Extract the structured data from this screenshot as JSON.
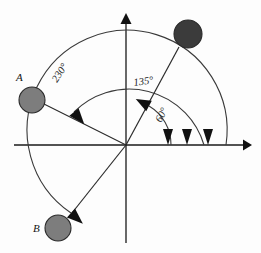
{
  "figure": {
    "background_color": "#fdfdfd",
    "width": 261,
    "height": 253
  },
  "axes": {
    "origin": {
      "x": 126,
      "y": 145
    },
    "x_axis_label": "",
    "y_axis_label": "",
    "x_axis": {
      "x1": 14,
      "y1": 145,
      "x2": 249,
      "y2": 145,
      "arrow": "right"
    },
    "y_axis": {
      "x1": 126,
      "y1": 243,
      "x2": 126,
      "y2": 16,
      "arrow": "up"
    }
  },
  "objects": [
    {
      "id": "ball-dark",
      "label": "",
      "cx": 188,
      "cy": 34,
      "r": 14,
      "fill": "#3b3b3b",
      "role": "initial-position"
    },
    {
      "id": "ball-a",
      "label": "A",
      "label_x": 20,
      "label_y": 80,
      "cx": 32,
      "cy": 100,
      "r": 13,
      "fill": "#7d7d7d",
      "role": "rotated-135"
    },
    {
      "id": "ball-b",
      "label": "B",
      "label_x": 36,
      "label_y": 228,
      "cx": 58,
      "cy": 228,
      "r": 13,
      "fill": "#7d7d7d",
      "role": "rotated-230"
    }
  ],
  "rays": [
    {
      "id": "ray-to-dark-ball",
      "from": "origin",
      "angle_deg": 60,
      "to_x": 178,
      "to_y": 46
    },
    {
      "id": "ray-to-ball-a",
      "from": "origin",
      "angle_deg": 195,
      "to_x": 44,
      "to_y": 105
    },
    {
      "id": "ray-to-ball-b",
      "from": "origin",
      "angle_deg": 250,
      "to_x": 68,
      "to_y": 218
    }
  ],
  "angles": [
    {
      "id": "angle-60",
      "label": "60°",
      "value": 60,
      "unit": "degrees",
      "label_x": 162,
      "label_y": 120,
      "label_rotation": -62,
      "arc_radius": 45,
      "direction": "counterclockwise",
      "from_deg": 0,
      "to_deg": 60
    },
    {
      "id": "angle-135",
      "label": "135°",
      "value": 135,
      "unit": "degrees",
      "label_x": 130,
      "label_y": 85,
      "label_rotation": -9,
      "arc_radius": 78,
      "direction": "counterclockwise",
      "from_deg": 0,
      "to_deg": 195
    },
    {
      "id": "angle-230",
      "label": "230°",
      "value": 230,
      "unit": "degrees",
      "label_x": 62,
      "label_y": 80,
      "label_rotation": -58,
      "arc_radius": 100,
      "direction": "counterclockwise",
      "from_deg": 0,
      "to_deg": 250
    }
  ],
  "arrow_marks": {
    "x_axis_terminal_arrows": [
      {
        "id": "terminal-arrow-1",
        "x": 168,
        "y": 145
      },
      {
        "id": "terminal-arrow-2",
        "x": 187,
        "y": 145
      },
      {
        "id": "terminal-arrow-3",
        "x": 208,
        "y": 145
      }
    ],
    "arc_end_arrow_60": {
      "x": 148,
      "y": 106,
      "rotation": -140
    },
    "arc_end_arrow_135": {
      "x": 76,
      "y": 113,
      "rotation": 118
    },
    "arc_end_arrow_230": {
      "x": 70,
      "y": 216,
      "rotation": 50
    }
  },
  "colors": {
    "stroke": "#1a1a1a",
    "ball_light": "#7d7d7d",
    "ball_dark": "#3b3b3b",
    "background": "#fdfdfd"
  }
}
